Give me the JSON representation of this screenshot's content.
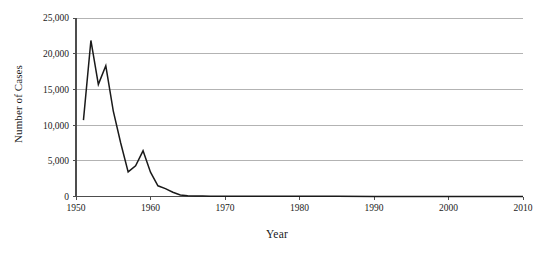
{
  "figure": {
    "clipped_caption_above": "",
    "background_color": "#ffffff"
  },
  "chart_data": {
    "type": "line",
    "title": "",
    "xlabel": "Year",
    "ylabel": "Number of Cases",
    "xlim": [
      1950,
      2010
    ],
    "ylim": [
      0,
      25000
    ],
    "grid": "horizontal",
    "legend": "none",
    "line_color": "#1a1a1a",
    "gridline_color": "#b3b3b3",
    "axis_color": "#4d4d4d",
    "xticks": [
      1950,
      1960,
      1970,
      1980,
      1990,
      2000,
      2010
    ],
    "xtick_labels": [
      "1950",
      "1960",
      "1970",
      "1980",
      "1990",
      "2000",
      "2010"
    ],
    "yticks": [
      0,
      5000,
      10000,
      15000,
      20000,
      25000
    ],
    "ytick_labels": [
      "0",
      "5,000",
      "10,000",
      "15,000",
      "20,000",
      "25,000"
    ],
    "series": [
      {
        "name": "Number of Cases",
        "x": [
          1951,
          1952,
          1953,
          1954,
          1955,
          1956,
          1957,
          1958,
          1959,
          1960,
          1961,
          1962,
          1963,
          1964,
          1965,
          1966,
          1967,
          1968,
          1969,
          1970,
          1975,
          1980,
          1985,
          1990,
          1995,
          2000,
          2005,
          2010
        ],
        "values": [
          10700,
          21850,
          15700,
          18300,
          12000,
          7500,
          3450,
          4300,
          6400,
          3400,
          1500,
          1100,
          600,
          200,
          120,
          80,
          60,
          50,
          45,
          40,
          30,
          25,
          20,
          15,
          12,
          10,
          8,
          5
        ]
      }
    ]
  }
}
